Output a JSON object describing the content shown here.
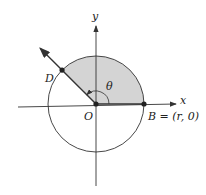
{
  "diagram": {
    "labels": {
      "x_axis": "x",
      "y_axis": "y",
      "angle": "θ",
      "origin": "O",
      "point_d": "D",
      "point_b": "B = (r, 0)"
    },
    "angle_degrees": 135,
    "colors": {
      "shade": "#d4d4d4",
      "stroke": "#333333"
    }
  }
}
